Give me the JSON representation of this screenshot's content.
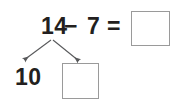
{
  "worksheet": {
    "type": "subtraction-number-bond",
    "equation": {
      "minuend": "14",
      "operator_minus": "−",
      "subtrahend": "7",
      "operator_equals": "=",
      "answer_value": ""
    },
    "decomposition": {
      "source_label": "14",
      "part_one": "10",
      "part_two_value": "",
      "arrow_left_name": "branch-arrow-left",
      "arrow_right_name": "branch-arrow-right"
    },
    "colors": {
      "text": "#231f20",
      "box_border": "#9a9a9a",
      "box_fill": "#ffffff",
      "arrow_stroke": "#58595b",
      "background": "#ffffff"
    }
  }
}
